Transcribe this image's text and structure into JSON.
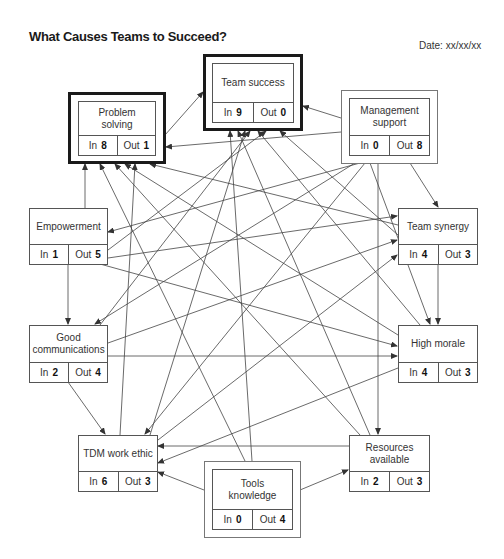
{
  "header": {
    "title": "What Causes Teams to Succeed?",
    "date": "Date: xx/xx/xx"
  },
  "labels": {
    "in": "In",
    "out": "Out"
  },
  "nodes": {
    "problem_solving": {
      "label": "Problem solving",
      "in": "8",
      "out": "1"
    },
    "team_success": {
      "label": "Team success",
      "in": "9",
      "out": "0"
    },
    "management_support": {
      "label": "Management support",
      "in": "0",
      "out": "8"
    },
    "empowerment": {
      "label": "Empowerment",
      "in": "1",
      "out": "5"
    },
    "team_synergy": {
      "label": "Team synergy",
      "in": "4",
      "out": "3"
    },
    "good_communications": {
      "label": "Good communications",
      "in": "2",
      "out": "4"
    },
    "high_morale": {
      "label": "High morale",
      "in": "4",
      "out": "3"
    },
    "tdm_work_ethic": {
      "label": "TDM work ethic",
      "in": "6",
      "out": "3"
    },
    "resources_available": {
      "label": "Resources available",
      "in": "2",
      "out": "3"
    },
    "tools_knowledge": {
      "label": "Tools knowledge",
      "in": "0",
      "out": "4"
    }
  },
  "key_drivers": [
    "management_support",
    "tools_knowledge"
  ],
  "key_outcomes": [
    "team_success",
    "problem_solving"
  ],
  "colors": {
    "line": "#444444",
    "thick_border": "#1a1a1a",
    "thin_border": "#777777"
  }
}
